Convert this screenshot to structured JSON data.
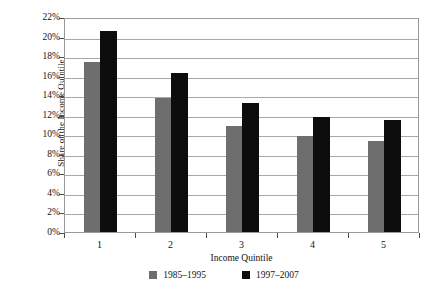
{
  "chart_data": {
    "type": "bar",
    "title": "",
    "xlabel": "Income Quintile",
    "ylabel": "Share of the Income Quintile",
    "categories": [
      "1",
      "2",
      "3",
      "4",
      "5"
    ],
    "series": [
      {
        "name": "1985–1995",
        "color": "#6e6e6e",
        "values": [
          17.4,
          13.7,
          10.8,
          9.8,
          9.3
        ]
      },
      {
        "name": "1997–2007",
        "color": "#0d0d0d",
        "values": [
          20.6,
          16.3,
          13.2,
          11.8,
          11.5
        ]
      }
    ],
    "ylim": [
      0,
      22
    ],
    "ytick_values": [
      0,
      2,
      4,
      6,
      8,
      10,
      12,
      14,
      16,
      18,
      20,
      22
    ],
    "ytick_labels": [
      "0%",
      "2%",
      "4%",
      "6%",
      "8%",
      "10%",
      "12%",
      "14%",
      "16%",
      "18%",
      "20%",
      "22%"
    ],
    "grid": true,
    "grid_axis": "y",
    "legend_position": "bottom-center",
    "plot_border": true,
    "background_color": "#ffffff",
    "gridline_color": "#a8a8a8",
    "axis_color": "#9a9a9a"
  }
}
